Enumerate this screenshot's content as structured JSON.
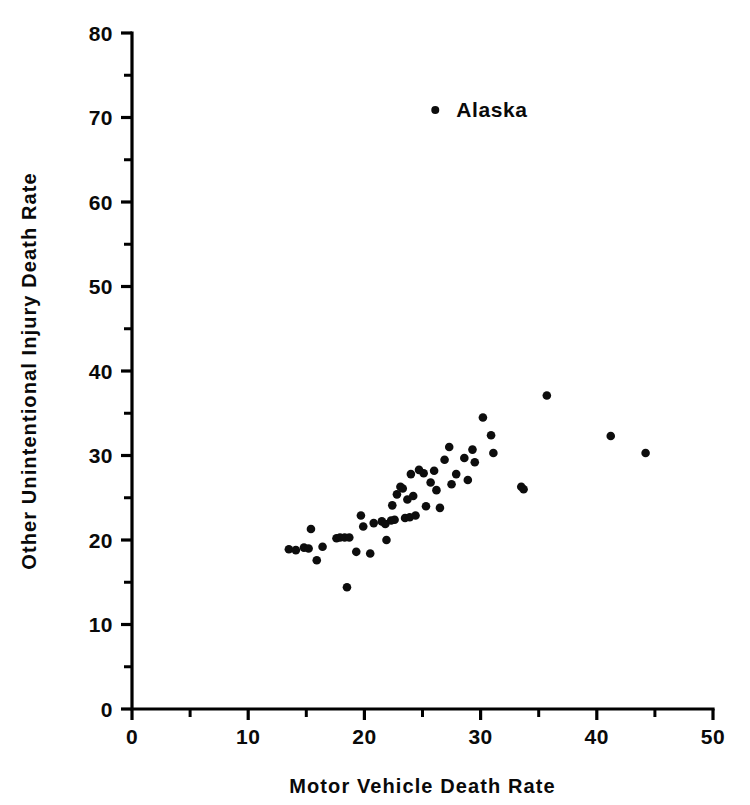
{
  "chart_data": {
    "type": "scatter",
    "title": "",
    "xlabel": "Motor Vehicle Death Rate",
    "ylabel": "Other Unintentional Injury Death Rate",
    "xlim": [
      0,
      50
    ],
    "ylim": [
      0,
      80
    ],
    "xticks": [
      0,
      10,
      20,
      30,
      40,
      50
    ],
    "yticks": [
      0,
      10,
      20,
      30,
      40,
      50,
      60,
      70,
      80
    ],
    "xtick_labels": [
      "0",
      "10",
      "20",
      "30",
      "40",
      "50"
    ],
    "ytick_labels": [
      "0",
      "10",
      "20",
      "30",
      "40",
      "50",
      "60",
      "70",
      "80"
    ],
    "x_minor_ticks": [
      5,
      15,
      25,
      35,
      45
    ],
    "y_minor_ticks": [
      5,
      15,
      25,
      35,
      45,
      55,
      65,
      75
    ],
    "grid": false,
    "legend": false,
    "marker": "filled-circle",
    "marker_color": "#0d0d0d",
    "series": [
      {
        "name": "States",
        "points": [
          [
            13.5,
            18.9
          ],
          [
            14.1,
            18.8
          ],
          [
            14.8,
            19.1
          ],
          [
            15.2,
            19.0
          ],
          [
            15.4,
            21.3
          ],
          [
            15.9,
            17.6
          ],
          [
            16.4,
            19.2
          ],
          [
            17.6,
            20.2
          ],
          [
            17.9,
            20.3
          ],
          [
            18.3,
            20.3
          ],
          [
            18.5,
            14.4
          ],
          [
            18.7,
            20.3
          ],
          [
            19.3,
            18.6
          ],
          [
            19.7,
            22.9
          ],
          [
            19.9,
            21.6
          ],
          [
            20.5,
            18.4
          ],
          [
            20.8,
            22.0
          ],
          [
            21.5,
            22.2
          ],
          [
            21.8,
            21.9
          ],
          [
            21.9,
            20.0
          ],
          [
            22.3,
            22.3
          ],
          [
            22.4,
            24.1
          ],
          [
            22.6,
            22.4
          ],
          [
            22.8,
            25.4
          ],
          [
            23.1,
            26.3
          ],
          [
            23.3,
            26.1
          ],
          [
            23.5,
            22.6
          ],
          [
            23.7,
            24.8
          ],
          [
            23.9,
            22.7
          ],
          [
            24.0,
            27.8
          ],
          [
            24.2,
            25.2
          ],
          [
            24.4,
            22.9
          ],
          [
            24.7,
            28.3
          ],
          [
            25.1,
            27.9
          ],
          [
            25.3,
            24.0
          ],
          [
            25.7,
            26.8
          ],
          [
            26.0,
            28.2
          ],
          [
            26.2,
            25.9
          ],
          [
            26.5,
            23.8
          ],
          [
            26.9,
            29.5
          ],
          [
            27.3,
            31.0
          ],
          [
            27.5,
            26.6
          ],
          [
            27.9,
            27.8
          ],
          [
            28.6,
            29.7
          ],
          [
            28.9,
            27.1
          ],
          [
            29.3,
            30.7
          ],
          [
            29.5,
            29.2
          ],
          [
            30.2,
            34.5
          ],
          [
            30.9,
            32.4
          ],
          [
            31.1,
            30.3
          ],
          [
            33.5,
            26.3
          ],
          [
            33.7,
            26.0
          ],
          [
            35.7,
            37.1
          ],
          [
            41.2,
            32.3
          ],
          [
            44.2,
            30.3
          ]
        ]
      }
    ],
    "annotations": [
      {
        "label": "Alaska",
        "x": 26.1,
        "y": 70.9,
        "label_offset_x": 1.8,
        "label_offset_y": 0.0
      }
    ]
  }
}
